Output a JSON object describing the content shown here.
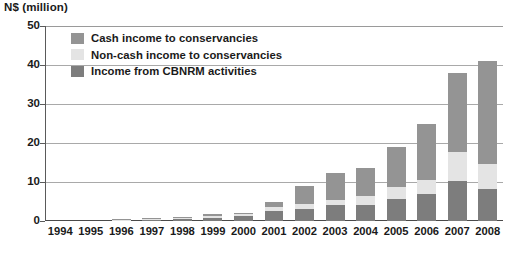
{
  "chart_data": {
    "type": "bar",
    "stacked": true,
    "title": "N$ (million)",
    "xlabel": "",
    "ylabel": "N$ (million)",
    "ylim": [
      0,
      50
    ],
    "yticks": [
      0,
      10,
      20,
      30,
      40,
      50
    ],
    "grid": true,
    "legend_position": "top-left",
    "categories": [
      "1994",
      "1995",
      "1996",
      "1997",
      "1998",
      "1999",
      "2000",
      "2001",
      "2002",
      "2003",
      "2004",
      "2005",
      "2006",
      "2007",
      "2008"
    ],
    "series": [
      {
        "name": "Income from CBNRM activities",
        "color": "#7d7d7d",
        "values": [
          0,
          0,
          0.2,
          0.4,
          0.6,
          0.9,
          1.3,
          2.6,
          3.2,
          4.0,
          4.2,
          5.6,
          7.0,
          10.2,
          8.3
        ]
      },
      {
        "name": "Non-cash income to conservancies",
        "color": "#e4e4e4",
        "values": [
          0,
          0,
          0.1,
          0.1,
          0.2,
          0.3,
          0.4,
          1.0,
          1.2,
          1.5,
          2.1,
          3.0,
          3.6,
          7.6,
          6.3
        ]
      },
      {
        "name": "Cash income to conservancies",
        "color": "#949494",
        "values": [
          0,
          0,
          0.1,
          0.2,
          0.3,
          0.6,
          0.4,
          1.2,
          4.6,
          6.8,
          7.3,
          10.4,
          14.4,
          20.2,
          26.4
        ]
      }
    ],
    "totals": [
      0,
      0,
      0.4,
      0.7,
      1.1,
      1.8,
      2.1,
      4.8,
      9.0,
      12.3,
      13.6,
      19.0,
      25.0,
      38.0,
      41.0
    ]
  },
  "legend": {
    "items": [
      {
        "label": "Cash income to conservancies",
        "color": "#949494"
      },
      {
        "label": "Non-cash income to conservancies",
        "color": "#e4e4e4"
      },
      {
        "label": "Income from CBNRM activities",
        "color": "#7d7d7d"
      }
    ]
  },
  "axis": {
    "y_title": "N$ (million)",
    "y_labels": [
      "50",
      "40",
      "30",
      "20",
      "10",
      "0"
    ],
    "x_labels": [
      "1994",
      "1995",
      "1996",
      "1997",
      "1998",
      "1999",
      "2000",
      "2001",
      "2002",
      "2003",
      "2004",
      "2005",
      "2006",
      "2007",
      "2008"
    ]
  },
  "colors": {
    "cash": "#949494",
    "noncash": "#e4e4e4",
    "cbnrm": "#7d7d7d",
    "grid": "#a9a9a9",
    "axis": "#4a4a4a",
    "text": "#1a1a1a",
    "background": "#ffffff"
  }
}
